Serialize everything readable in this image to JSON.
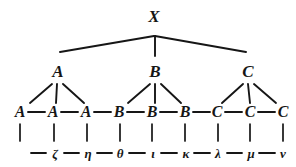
{
  "figure": {
    "ink_color": "#161616",
    "background_color": "#ffffff",
    "width": 296,
    "height": 167
  },
  "levels": {
    "root": {
      "name": "level-0-root",
      "nodes": [
        {
          "id": "X",
          "label": "X",
          "x": 154,
          "y": 22
        }
      ]
    },
    "branches": {
      "name": "level-1-branches",
      "nodes": [
        {
          "id": "A1",
          "label": "A",
          "x": 58,
          "y": 77
        },
        {
          "id": "B1",
          "label": "B",
          "x": 155,
          "y": 77
        },
        {
          "id": "C1",
          "label": "C",
          "x": 248,
          "y": 77
        }
      ]
    },
    "leaves": {
      "name": "level-2-leaves",
      "nodes": [
        {
          "id": "L1",
          "label": "A",
          "x": 20,
          "y": 117
        },
        {
          "id": "L2",
          "label": "A",
          "x": 53,
          "y": 117
        },
        {
          "id": "L3",
          "label": "A",
          "x": 86,
          "y": 117
        },
        {
          "id": "L4",
          "label": "B",
          "x": 119,
          "y": 117
        },
        {
          "id": "L5",
          "label": "B",
          "x": 152,
          "y": 117
        },
        {
          "id": "L6",
          "label": "B",
          "x": 185,
          "y": 117
        },
        {
          "id": "L7",
          "label": "C",
          "x": 217,
          "y": 117
        },
        {
          "id": "L8",
          "label": "C",
          "x": 250,
          "y": 117
        },
        {
          "id": "L9",
          "label": "C",
          "x": 283,
          "y": 117
        }
      ]
    },
    "terminals": {
      "name": "level-3-terminals",
      "nodes": [
        {
          "id": "T1",
          "label": "",
          "x": 20,
          "y": 158
        },
        {
          "id": "T2",
          "label": "ζ",
          "x": 55,
          "y": 158
        },
        {
          "id": "T3",
          "label": "η",
          "x": 88,
          "y": 158
        },
        {
          "id": "T4",
          "label": "θ",
          "x": 120,
          "y": 158
        },
        {
          "id": "T5",
          "label": "ι",
          "x": 153,
          "y": 158
        },
        {
          "id": "T6",
          "label": "κ",
          "x": 186,
          "y": 158
        },
        {
          "id": "T7",
          "label": "λ",
          "x": 218,
          "y": 158
        },
        {
          "id": "T8",
          "label": "μ",
          "x": 251,
          "y": 158
        },
        {
          "id": "T9",
          "label": "ν",
          "x": 283,
          "y": 158
        }
      ]
    }
  },
  "edges": {
    "root_to_branches": [
      {
        "from": "X",
        "to": "A1",
        "x1": 154,
        "y1": 36,
        "x2": 60,
        "y2": 52
      },
      {
        "from": "X",
        "to": "B1",
        "x1": 155,
        "y1": 36,
        "x2": 155,
        "y2": 56
      },
      {
        "from": "X",
        "to": "C1",
        "x1": 155,
        "y1": 36,
        "x2": 246,
        "y2": 52
      }
    ],
    "branch_to_leaves": [
      {
        "from": "A1",
        "to": "L2_left",
        "x1": 52,
        "y1": 84,
        "x2": 30,
        "y2": 103
      },
      {
        "from": "A1",
        "to": "L2_mid",
        "x1": 57,
        "y1": 84,
        "x2": 56,
        "y2": 103
      },
      {
        "from": "A1",
        "to": "L2_right",
        "x1": 63,
        "y1": 84,
        "x2": 84,
        "y2": 103
      },
      {
        "from": "B1",
        "to": "L5_left",
        "x1": 150,
        "y1": 84,
        "x2": 128,
        "y2": 103
      },
      {
        "from": "B1",
        "to": "L5_mid",
        "x1": 155,
        "y1": 84,
        "x2": 155,
        "y2": 103
      },
      {
        "from": "B1",
        "to": "L5_right",
        "x1": 161,
        "y1": 84,
        "x2": 181,
        "y2": 103
      },
      {
        "from": "C1",
        "to": "L8_left",
        "x1": 243,
        "y1": 84,
        "x2": 222,
        "y2": 103
      },
      {
        "from": "C1",
        "to": "L8_mid",
        "x1": 248,
        "y1": 84,
        "x2": 250,
        "y2": 103
      },
      {
        "from": "C1",
        "to": "L8_right",
        "x1": 254,
        "y1": 84,
        "x2": 276,
        "y2": 103
      }
    ],
    "leaf_chain": [
      {
        "from": "L1",
        "to": "L2",
        "x1": 28,
        "y1": 112,
        "x2": 45,
        "y2": 112
      },
      {
        "from": "L2",
        "to": "L3",
        "x1": 61,
        "y1": 112,
        "x2": 78,
        "y2": 112
      },
      {
        "from": "L3",
        "to": "L4",
        "x1": 94,
        "y1": 112,
        "x2": 111,
        "y2": 112
      },
      {
        "from": "L4",
        "to": "L5",
        "x1": 127,
        "y1": 112,
        "x2": 144,
        "y2": 112
      },
      {
        "from": "L5",
        "to": "L6",
        "x1": 160,
        "y1": 112,
        "x2": 177,
        "y2": 112
      },
      {
        "from": "L6",
        "to": "L7",
        "x1": 193,
        "y1": 112,
        "x2": 210,
        "y2": 112
      },
      {
        "from": "L7",
        "to": "L8",
        "x1": 225,
        "y1": 112,
        "x2": 242,
        "y2": 112
      },
      {
        "from": "L8",
        "to": "L9",
        "x1": 258,
        "y1": 112,
        "x2": 275,
        "y2": 112
      }
    ],
    "leaf_drops": [
      {
        "from": "L1",
        "x1": 20,
        "y1": 124,
        "x2": 20,
        "y2": 141
      },
      {
        "from": "L2",
        "x1": 54,
        "y1": 124,
        "x2": 54,
        "y2": 141
      },
      {
        "from": "L3",
        "x1": 87,
        "y1": 124,
        "x2": 87,
        "y2": 141
      },
      {
        "from": "L4",
        "x1": 120,
        "y1": 124,
        "x2": 120,
        "y2": 141
      },
      {
        "from": "L5",
        "x1": 152,
        "y1": 124,
        "x2": 152,
        "y2": 141
      },
      {
        "from": "L6",
        "x1": 185,
        "y1": 124,
        "x2": 185,
        "y2": 141
      },
      {
        "from": "L7",
        "x1": 218,
        "y1": 124,
        "x2": 218,
        "y2": 141
      },
      {
        "from": "L8",
        "x1": 250,
        "y1": 124,
        "x2": 250,
        "y2": 141
      },
      {
        "from": "L9",
        "x1": 283,
        "y1": 124,
        "x2": 283,
        "y2": 141
      }
    ],
    "terminal_chain": [
      {
        "from": "T1",
        "to": "T2",
        "x1": 31,
        "y1": 153,
        "x2": 46,
        "y2": 153
      },
      {
        "from": "T2",
        "to": "T3",
        "x1": 64,
        "y1": 153,
        "x2": 79,
        "y2": 153
      },
      {
        "from": "T3",
        "to": "T4",
        "x1": 97,
        "y1": 153,
        "x2": 112,
        "y2": 153
      },
      {
        "from": "T4",
        "to": "T5",
        "x1": 129,
        "y1": 153,
        "x2": 145,
        "y2": 153
      },
      {
        "from": "T5",
        "to": "T6",
        "x1": 161,
        "y1": 153,
        "x2": 177,
        "y2": 153
      },
      {
        "from": "T6",
        "to": "T7",
        "x1": 194,
        "y1": 153,
        "x2": 210,
        "y2": 153
      },
      {
        "from": "T7",
        "to": "T8",
        "x1": 227,
        "y1": 153,
        "x2": 242,
        "y2": 153
      },
      {
        "from": "T8",
        "to": "T9",
        "x1": 259,
        "y1": 153,
        "x2": 275,
        "y2": 153
      }
    ]
  }
}
